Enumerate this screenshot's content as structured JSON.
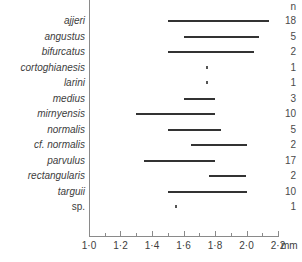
{
  "chart_data": {
    "type": "bar",
    "chart_subtype": "horizontal-range",
    "title": "",
    "xlabel": "mm",
    "ylabel": "",
    "xlim": [
      1.0,
      2.2
    ],
    "grid": false,
    "legend": null,
    "column_header": "n",
    "x_ticks": [
      "1·0",
      "1·2",
      "1·4",
      "1·6",
      "1·8",
      "2·0",
      "2·2"
    ],
    "x_tick_values": [
      1.0,
      1.2,
      1.4,
      1.6,
      1.8,
      2.0,
      2.2
    ],
    "x_minor_step": 0.1,
    "unit_label": "mm",
    "categories": [
      "ajjeri",
      "angustus",
      "bifurcatus",
      "cortoghianesis",
      "larini",
      "medius",
      "mirnyensis",
      "normalis",
      "cf. normalis",
      "parvulus",
      "rectangularis",
      "targuii",
      "sp."
    ],
    "rows": [
      {
        "label": "ajjeri",
        "italic": true,
        "min": 1.5,
        "max": 2.14,
        "n": "18",
        "kind": "range"
      },
      {
        "label": "angustus",
        "italic": true,
        "min": 1.6,
        "max": 2.08,
        "n": "5",
        "kind": "range"
      },
      {
        "label": "bifurcatus",
        "italic": true,
        "min": 1.5,
        "max": 2.05,
        "n": "2",
        "kind": "range"
      },
      {
        "label": "cortoghianesis",
        "italic": true,
        "min": 1.75,
        "max": 1.75,
        "n": "1",
        "kind": "point"
      },
      {
        "label": "larini",
        "italic": true,
        "min": 1.75,
        "max": 1.75,
        "n": "1",
        "kind": "point"
      },
      {
        "label": "medius",
        "italic": true,
        "min": 1.6,
        "max": 1.8,
        "n": "3",
        "kind": "range"
      },
      {
        "label": "mirnyensis",
        "italic": true,
        "min": 1.3,
        "max": 1.8,
        "n": "10",
        "kind": "range"
      },
      {
        "label": "normalis",
        "italic": true,
        "min": 1.5,
        "max": 1.84,
        "n": "5",
        "kind": "range"
      },
      {
        "label": "cf. normalis",
        "italic": true,
        "min": 1.65,
        "max": 2.0,
        "n": "2",
        "kind": "range"
      },
      {
        "label": "parvulus",
        "italic": true,
        "min": 1.35,
        "max": 1.8,
        "n": "17",
        "kind": "range"
      },
      {
        "label": "rectangularis",
        "italic": true,
        "min": 1.76,
        "max": 2.0,
        "n": "2",
        "kind": "range"
      },
      {
        "label": "targuii",
        "italic": true,
        "min": 1.5,
        "max": 2.0,
        "n": "10",
        "kind": "range"
      },
      {
        "label": "sp.",
        "italic": false,
        "min": 1.55,
        "max": 1.55,
        "n": "1",
        "kind": "point"
      }
    ],
    "colors": {
      "bar": "#333333",
      "axis": "#8a8a8a",
      "text": "#3d3d3d",
      "background": "#ffffff"
    }
  }
}
